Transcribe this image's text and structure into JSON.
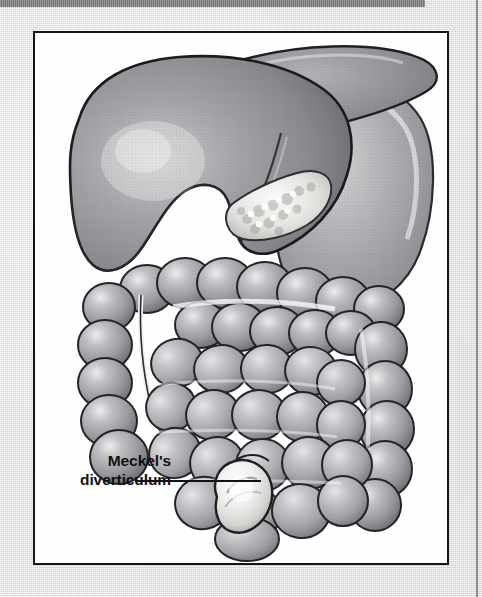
{
  "page": {
    "width": 482,
    "height": 597,
    "background_color": "#e8e8e8",
    "paper_tone": "light gray halftone scan"
  },
  "top_rule": {
    "name": "top-gray-rule",
    "color": "#848484",
    "width": 425,
    "height": 7
  },
  "right_rule": {
    "name": "right-page-edge-rule",
    "color": "#8c8c8c"
  },
  "figure": {
    "frame_color": "#15151a",
    "frame_background": "#ffffff",
    "title": "",
    "caption": "",
    "medium": "grayscale halftone medical illustration",
    "organs": [
      {
        "name": "liver",
        "tone": "#8e8e92"
      },
      {
        "name": "stomach",
        "tone": "#a9a9ad"
      },
      {
        "name": "pancreas",
        "tone": "#efefee"
      },
      {
        "name": "transverse-colon",
        "tone": "#9b9b9f"
      },
      {
        "name": "ascending-colon",
        "tone": "#949498"
      },
      {
        "name": "descending-colon",
        "tone": "#949498"
      },
      {
        "name": "small-intestine",
        "tone": "#a2a2a6"
      },
      {
        "name": "cecum",
        "tone": "#9a9a9e"
      },
      {
        "name": "meckels-diverticulum",
        "tone": "#f2f2f0"
      }
    ]
  },
  "annotation": {
    "label_line_1": "Meckel's",
    "label_line_2": "diverticulum",
    "leader_line_color": "#121216",
    "points_to": "meckels-diverticulum"
  }
}
